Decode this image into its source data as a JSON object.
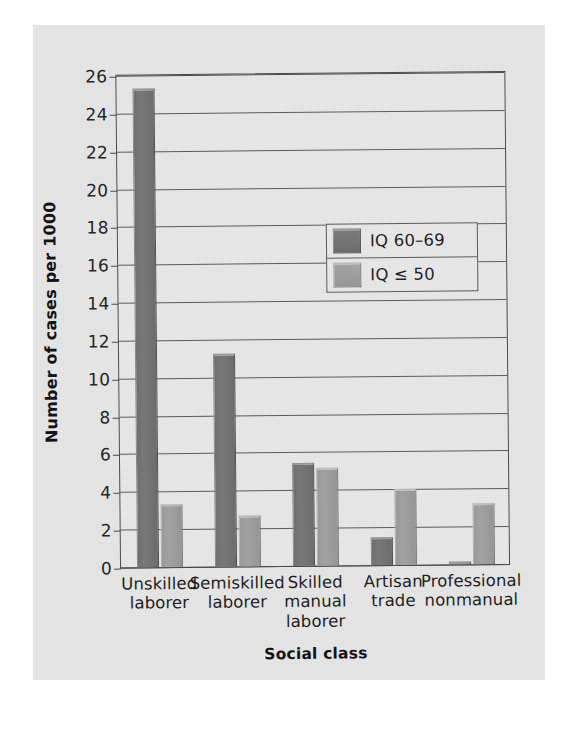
{
  "chart_data": {
    "type": "bar",
    "title": "",
    "xlabel": "Social class",
    "ylabel": "Number of cases per 1000",
    "ylim": [
      0,
      26
    ],
    "ytick_step": 2,
    "yticks": [
      0,
      2,
      4,
      6,
      8,
      10,
      12,
      14,
      16,
      18,
      20,
      22,
      24,
      26
    ],
    "grid": "horizontal",
    "legend_position": "upper-center-right",
    "categories": [
      "Unskilled laborer",
      "Semiskilled laborer",
      "Skilled manual laborer",
      "Artisan trade",
      "Professional nonmanual"
    ],
    "category_lines": [
      [
        "Unskilled",
        "laborer"
      ],
      [
        "Semiskilled",
        "laborer"
      ],
      [
        "Skilled",
        "manual",
        "laborer"
      ],
      [
        "Artisan",
        "trade"
      ],
      [
        "Professional",
        "nonmanual"
      ]
    ],
    "series": [
      {
        "name": "IQ 60–69",
        "color": "#6f6f6f",
        "values": [
          25.2,
          11.2,
          5.4,
          1.5,
          0.15
        ]
      },
      {
        "name": "IQ ≤ 50",
        "color": "#9a9a9a",
        "values": [
          3.3,
          2.7,
          5.15,
          4.0,
          3.2
        ]
      }
    ]
  },
  "legend": {
    "items": [
      {
        "label": "IQ 60–69",
        "style": "dark"
      },
      {
        "label": "IQ ≤ 50",
        "style": "light"
      }
    ]
  },
  "colors": {
    "page_background": "#e6e6e6",
    "plot_background": "#e8e8e8",
    "axis": "#4a4a4a",
    "gridline": "#5a5a5a",
    "series_dark": "#6f6f6f",
    "series_light": "#9a9a9a",
    "text": "#1c1c1c"
  }
}
